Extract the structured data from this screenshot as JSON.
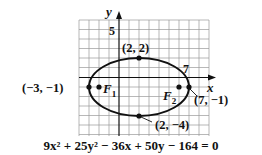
{
  "figure": {
    "axis_labels": {
      "x": "x",
      "y": "y"
    },
    "tick_labels": {
      "y_tick": "5",
      "x_tick": "7"
    },
    "points": {
      "top": {
        "label": "(2, 2)",
        "x": 2,
        "y": 2
      },
      "bottom": {
        "label": "(2, −4)",
        "x": 2,
        "y": -4
      },
      "left_vertex": {
        "label": "(−3, −1)",
        "x": -3,
        "y": -1
      },
      "right_vertex": {
        "label": "(7, −1)",
        "x": 7,
        "y": -1
      }
    },
    "foci": {
      "f1": {
        "label": "F",
        "subscript": "1",
        "x": -2,
        "y": -1
      },
      "f2": {
        "label": "F",
        "subscript": "2",
        "x": 6,
        "y": -1
      }
    },
    "ellipse": {
      "center": [
        2,
        -1
      ],
      "semi_major": 5,
      "semi_minor": 3
    },
    "equation": "9x² + 25y² − 36x + 50y − 164 = 0",
    "grid": {
      "x_range": [
        -4,
        9
      ],
      "y_range": [
        -6,
        6
      ]
    },
    "colors": {
      "ink": "#111111",
      "grid": "#9a9a9a",
      "background": "#ffffff"
    }
  }
}
